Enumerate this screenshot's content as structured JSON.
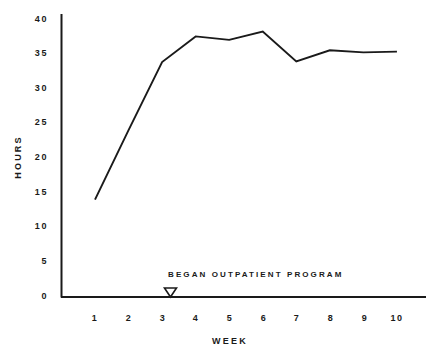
{
  "chart_data": {
    "type": "line",
    "title": "",
    "xlabel": "WEEK",
    "ylabel": "HOURS",
    "x": [
      1,
      2,
      3,
      4,
      5,
      6,
      7,
      8,
      9,
      10
    ],
    "categories": [
      "1",
      "2",
      "3",
      "4",
      "5",
      "6",
      "7",
      "8",
      "9",
      "10"
    ],
    "values": [
      14.0,
      24.0,
      33.8,
      37.5,
      37.0,
      38.2,
      33.9,
      35.5,
      35.2,
      35.3
    ],
    "series": [
      {
        "name": "Hours",
        "values": [
          14.0,
          24.0,
          33.8,
          37.5,
          37.0,
          38.2,
          33.9,
          35.5,
          35.2,
          35.3
        ]
      }
    ],
    "xlim": [
      0.6,
      10.4
    ],
    "ylim": [
      0,
      41
    ],
    "yticks": [
      0,
      5,
      10,
      15,
      20,
      25,
      30,
      35,
      40
    ],
    "ytick_labels": [
      "0",
      "5",
      "10",
      "15",
      "20",
      "25",
      "30",
      "35",
      "40"
    ],
    "xticks": [
      1,
      2,
      3,
      4,
      5,
      6,
      7,
      8,
      9,
      10
    ],
    "xtick_labels": [
      "1",
      "2",
      "3",
      "4",
      "5",
      "6",
      "7",
      "8",
      "9",
      "10"
    ],
    "grid": false,
    "legend": false,
    "legend_position": "none",
    "line_color": "#1a1a1a",
    "background_color": "#ffffff",
    "annotations": [
      {
        "text": "BEGAN  OUTPATIENT  PROGRAM",
        "marker": "down-triangle-marker",
        "marker_x": 3.25,
        "marker_y": 0
      }
    ]
  },
  "axes": {
    "y_axis_name": "hours-axis",
    "x_axis_name": "week-axis"
  }
}
